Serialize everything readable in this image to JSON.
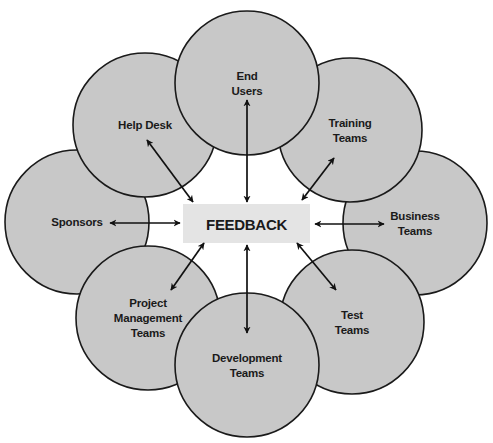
{
  "colors": {
    "circle_fill": "#c8c8c8",
    "circle_stroke": "#1a1a1a",
    "center_fill": "#e4e4e4",
    "arrow": "#111111",
    "background": "#ffffff"
  },
  "center": {
    "label": "FEEDBACK",
    "box": {
      "x": 183,
      "y": 204,
      "w": 127,
      "h": 39
    }
  },
  "radius": 72,
  "nodes": [
    {
      "id": "end-users",
      "lines": [
        "End",
        "Users"
      ],
      "cx": 247,
      "cy": 83,
      "arrow": [
        247,
        100,
        247,
        202
      ]
    },
    {
      "id": "help-desk",
      "lines": [
        "Help Desk"
      ],
      "cx": 145,
      "cy": 125,
      "arrow": [
        147,
        140,
        193,
        202
      ]
    },
    {
      "id": "training-teams",
      "lines": [
        "Training",
        "Teams"
      ],
      "cx": 350,
      "cy": 130,
      "arrow": [
        334,
        158,
        302,
        200
      ]
    },
    {
      "id": "sponsors",
      "lines": [
        "Sponsors"
      ],
      "cx": 77,
      "cy": 222,
      "arrow": [
        110,
        223,
        180,
        223
      ]
    },
    {
      "id": "business-teams",
      "lines": [
        "Business",
        "Teams"
      ],
      "cx": 415,
      "cy": 223,
      "arrow": [
        315,
        224,
        384,
        224
      ]
    },
    {
      "id": "project-management-teams",
      "lines": [
        "Project",
        "Management",
        "Teams"
      ],
      "cx": 148,
      "cy": 318,
      "arrow": [
        204,
        243,
        171,
        290
      ]
    },
    {
      "id": "test-teams",
      "lines": [
        "Test",
        "Teams"
      ],
      "cx": 352,
      "cy": 322,
      "arrow": [
        297,
        243,
        336,
        290
      ]
    },
    {
      "id": "development-teams",
      "lines": [
        "Development",
        "Teams"
      ],
      "cx": 247,
      "cy": 365,
      "arrow": [
        247,
        245,
        247,
        333
      ]
    }
  ],
  "draw_order": [
    "sponsors",
    "business-teams",
    "help-desk",
    "training-teams",
    "project-management-teams",
    "test-teams",
    "end-users",
    "development-teams"
  ]
}
